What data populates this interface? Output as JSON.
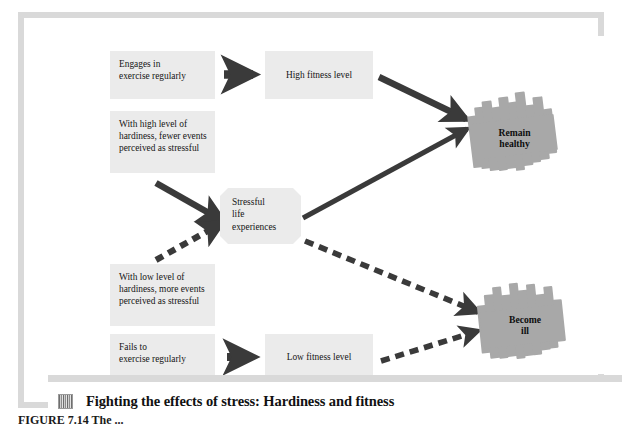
{
  "figure": {
    "caption": "Fighting the effects of stress: Hardiness and fitness",
    "caption_icon": "photo-thumbnail-icon",
    "bottom_clipped_line": "FIGURE 7.14 The ...",
    "frame_color": "#d9d9d9",
    "box_fill": "#ebebeb",
    "blob_fill": "#a8a8a8",
    "arrow_color": "#3a3a3a",
    "text_color": "#161616"
  },
  "nodes": {
    "engages": {
      "label": "Engages in\nexercise regularly"
    },
    "high_fitness": {
      "label": "High fitness level"
    },
    "high_hardiness": {
      "label": "With high level of\nhardiness, fewer events\nperceived as stressful"
    },
    "low_hardiness": {
      "label": "With low level of\nhardiness, more events\nperceived as stressful"
    },
    "fails": {
      "label": "Fails to\nexercise regularly"
    },
    "low_fitness": {
      "label": "Low fitness level"
    },
    "stress": {
      "label": "Stressful\nlife\nexperiences"
    },
    "remain_healthy": {
      "label": "Remain\nhealthy"
    },
    "become_ill": {
      "label": "Become\nill"
    }
  },
  "edges": [
    {
      "id": "engages-to-highfitness",
      "from": "engages",
      "to": "high_fitness",
      "style": "solid"
    },
    {
      "id": "highfitness-to-remainhealthy",
      "from": "high_fitness",
      "to": "remain_healthy",
      "style": "solid"
    },
    {
      "id": "highhardiness-to-stress",
      "from": "high_hardiness",
      "to": "stress",
      "style": "solid"
    },
    {
      "id": "lowhardiness-to-stress",
      "from": "low_hardiness",
      "to": "stress",
      "style": "dashed"
    },
    {
      "id": "stress-to-remainhealthy",
      "from": "stress",
      "to": "remain_healthy",
      "style": "solid"
    },
    {
      "id": "stress-to-becomeill",
      "from": "stress",
      "to": "become_ill",
      "style": "dashed"
    },
    {
      "id": "fails-to-lowfitness",
      "from": "fails",
      "to": "low_fitness",
      "style": "dashed"
    },
    {
      "id": "lowfitness-to-becomeill",
      "from": "low_fitness",
      "to": "become_ill",
      "style": "dashed"
    }
  ]
}
